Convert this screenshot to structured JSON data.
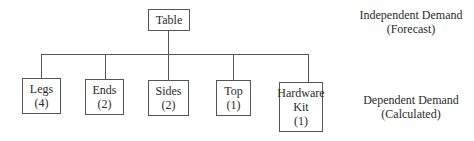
{
  "diagram": {
    "root": {
      "label": "Table"
    },
    "children": [
      {
        "name": "Legs",
        "qty": "(4)"
      },
      {
        "name": "Ends",
        "qty": "(2)"
      },
      {
        "name": "Sides",
        "qty": "(2)"
      },
      {
        "name": "Top",
        "qty": "(1)"
      },
      {
        "name_line1": "Hardware",
        "name_line2": "Kit",
        "qty": "(1)"
      }
    ],
    "levels": {
      "independent": {
        "line1": "Independent Demand",
        "line2": "(Forecast)"
      },
      "dependent": {
        "line1": "Dependent Demand",
        "line2": "(Calculated)"
      }
    }
  }
}
